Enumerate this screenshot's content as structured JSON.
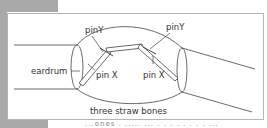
{
  "diagram": {
    "labels": {
      "pin_y_left": "pinY",
      "pin_y_right": "pinY",
      "pin_x_left": "pin X",
      "pin_x_right": "pin X",
      "eardrum": "eardrum",
      "bones": "three straw bones"
    }
  },
  "caption": {
    "text": "...ones . ..... ... . . . . . . . . ..."
  }
}
